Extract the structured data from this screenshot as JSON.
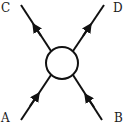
{
  "diagram": {
    "type": "feynman-vertex",
    "labels": {
      "top_left": "C",
      "top_right": "D",
      "bottom_left": "A",
      "bottom_right": "B"
    },
    "center": {
      "shape": "circle",
      "x": 62,
      "y": 63,
      "r": 16
    },
    "lines": [
      {
        "name": "A",
        "from": "A",
        "to": "vertex",
        "arrow": "toward-vertex"
      },
      {
        "name": "B",
        "from": "B",
        "to": "vertex",
        "arrow": "toward-vertex"
      },
      {
        "name": "C",
        "from": "vertex",
        "to": "C",
        "arrow": "away-from-vertex"
      },
      {
        "name": "D",
        "from": "vertex",
        "to": "D",
        "arrow": "away-from-vertex"
      }
    ],
    "colors": {
      "stroke": "#111111",
      "background": "#ffffff"
    }
  }
}
